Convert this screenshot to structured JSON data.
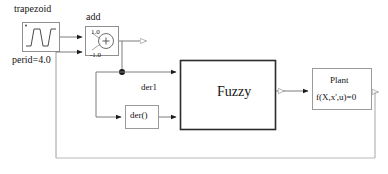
{
  "diagram": {
    "frame": {
      "name": "outer-loop-frame"
    },
    "blocks": [
      {
        "id": "trapezoid",
        "label": "trapezoid",
        "sublabel": "perid=4.0",
        "icon": "trapezoid-waveform-icon",
        "x": 22,
        "y": 22,
        "w": 38,
        "h": 30
      },
      {
        "id": "add",
        "label": "add",
        "gain_positive": "1.0",
        "gain_negative": "-1.0",
        "operator": "+",
        "x": 85,
        "y": 26,
        "w": 34,
        "h": 30
      },
      {
        "id": "der1",
        "label": "der1",
        "body": "der()",
        "x": 125,
        "y": 105,
        "w": 34,
        "h": 24
      },
      {
        "id": "fuzzy",
        "label": "Fuzzy",
        "x": 180,
        "y": 60,
        "w": 96,
        "h": 70
      },
      {
        "id": "plant",
        "label": "Plant",
        "equation": "f(X,x',u)=0",
        "x": 312,
        "y": 68,
        "w": 60,
        "h": 42
      }
    ],
    "connections": [
      {
        "from": "trapezoid",
        "to": "add.in1",
        "name": "trapezoid-to-add-positive"
      },
      {
        "from": "feedback",
        "to": "add.in2",
        "name": "feedback-to-add-negative"
      },
      {
        "from": "add",
        "to": "branch-junction",
        "name": "add-to-junction"
      },
      {
        "from": "branch-junction",
        "to": "fuzzy.in1",
        "name": "error-to-fuzzy"
      },
      {
        "from": "branch-junction",
        "to": "der1",
        "name": "error-to-derivative"
      },
      {
        "from": "der1",
        "to": "fuzzy.in2",
        "name": "derivative-to-fuzzy"
      },
      {
        "from": "fuzzy",
        "to": "plant",
        "name": "fuzzy-to-plant"
      },
      {
        "from": "plant",
        "to": "feedback",
        "name": "plant-output-feedback"
      }
    ],
    "colors": {
      "line": "#6b6b6b",
      "block_border": "#8a8a8a",
      "fuzzy_border": "#2b2b2b",
      "text": "#141414",
      "background": "#ffffff"
    }
  }
}
